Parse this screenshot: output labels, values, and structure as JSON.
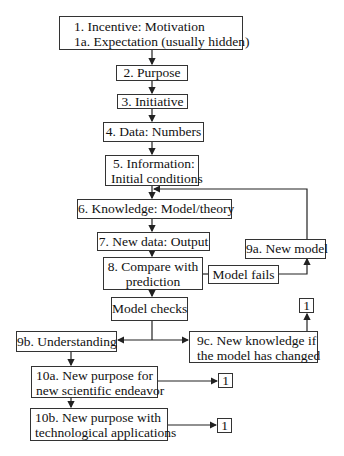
{
  "diagram": {
    "nodes": {
      "n1": {
        "lines": [
          "1. Incentive: Motivation",
          "1a. Expectation (usually hidden)"
        ]
      },
      "n2": {
        "lines": [
          "2. Purpose"
        ]
      },
      "n3": {
        "lines": [
          "3. Initiative"
        ]
      },
      "n4": {
        "lines": [
          "4. Data: Numbers"
        ]
      },
      "n5": {
        "lines": [
          "5. Information:",
          "Initial conditions"
        ]
      },
      "n6": {
        "lines": [
          "6. Knowledge: Model/theory"
        ]
      },
      "n7": {
        "lines": [
          "7. New data: Output"
        ]
      },
      "n8": {
        "lines": [
          "8. Compare with",
          "prediction"
        ]
      },
      "fails": {
        "lines": [
          "Model fails"
        ]
      },
      "n9a": {
        "lines": [
          "9a. New model"
        ]
      },
      "checks": {
        "lines": [
          "Model checks"
        ]
      },
      "n9b": {
        "lines": [
          "9b. Understanding"
        ]
      },
      "n9c": {
        "lines": [
          "9c. New knowledge if",
          "the model has changed"
        ]
      },
      "n10a": {
        "lines": [
          "10a. New purpose for",
          "new scientific endeavor"
        ]
      },
      "n10b": {
        "lines": [
          "10b. New purpose with",
          "technological applications"
        ]
      },
      "ref9c": {
        "lines": [
          "1"
        ]
      },
      "ref10a": {
        "lines": [
          "1"
        ]
      },
      "ref10b": {
        "lines": [
          "1"
        ]
      }
    },
    "edges": [
      {
        "from": "1",
        "to": "2"
      },
      {
        "from": "2",
        "to": "3"
      },
      {
        "from": "3",
        "to": "4"
      },
      {
        "from": "4",
        "to": "5"
      },
      {
        "from": "5",
        "to": "6"
      },
      {
        "from": "6",
        "to": "7"
      },
      {
        "from": "7",
        "to": "8"
      },
      {
        "from": "8",
        "to": "Model fails"
      },
      {
        "from": "Model fails",
        "to": "9a"
      },
      {
        "from": "9a",
        "to": "6"
      },
      {
        "from": "8",
        "to": "Model checks"
      },
      {
        "from": "Model checks",
        "to": "9b"
      },
      {
        "from": "Model checks",
        "to": "9c"
      },
      {
        "from": "9c",
        "to": "1"
      },
      {
        "from": "9b",
        "to": "10a"
      },
      {
        "from": "10a",
        "to": "10b"
      },
      {
        "from": "10a",
        "to": "1"
      },
      {
        "from": "10b",
        "to": "1"
      }
    ],
    "colors": {
      "line": "#222222",
      "border": "#333333",
      "background": "#ffffff"
    }
  }
}
